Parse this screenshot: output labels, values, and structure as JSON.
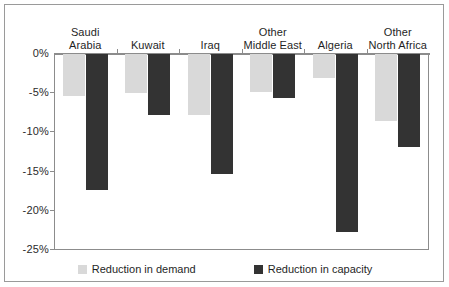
{
  "chart_data": {
    "type": "bar",
    "title": "",
    "subtitle": "",
    "xlabel": "",
    "ylabel": "",
    "grid": false,
    "legend_position": "bottom",
    "ylim": [
      -25,
      0
    ],
    "yticks": [
      0,
      -5,
      -10,
      -15,
      -20,
      -25
    ],
    "ytick_labels": [
      "0%",
      "-5%",
      "-10%",
      "-15%",
      "-20%",
      "-25%"
    ],
    "categories": [
      "Saudi Arabia",
      "Kuwait",
      "Iraq",
      "Other Middle East",
      "Algeria",
      "Other North Africa"
    ],
    "category_lines": [
      [
        "Saudi",
        "Arabia"
      ],
      [
        "Kuwait"
      ],
      [
        "Iraq"
      ],
      [
        "Other",
        "Middle East"
      ],
      [
        "Algeria"
      ],
      [
        "Other",
        "North Africa"
      ]
    ],
    "series": [
      {
        "name": "Reduction in demand",
        "color": "#d9d9d9",
        "values": [
          -5.3,
          -5.0,
          -7.8,
          -4.8,
          -3.0,
          -8.5
        ]
      },
      {
        "name": "Reduction in capacity",
        "color": "#333333",
        "values": [
          -17.3,
          -7.8,
          -15.3,
          -5.6,
          -22.7,
          -11.9
        ]
      }
    ]
  },
  "legend": {
    "items": [
      {
        "label": "Reduction in demand",
        "swatch": "demand"
      },
      {
        "label": "Reduction in capacity",
        "swatch": "capacity"
      }
    ]
  },
  "colors": {
    "demand": "#d9d9d9",
    "capacity": "#333333",
    "axis": "#8c8c8c",
    "frame": "#9a9a9a",
    "text": "#1f1f1f",
    "background": "#ffffff"
  }
}
